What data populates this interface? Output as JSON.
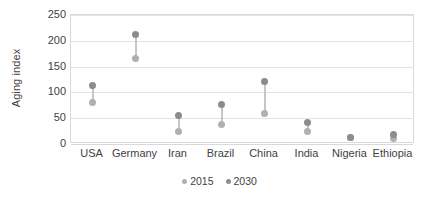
{
  "chart_data": {
    "type": "scatter",
    "title": "",
    "subtitle": "",
    "xlabel": "",
    "ylabel": "Aging index",
    "categories": [
      "USA",
      "Germany",
      "Iran",
      "Brazil",
      "China",
      "India",
      "Nigeria",
      "Ethiopia"
    ],
    "series": [
      {
        "name": "2015",
        "color": "#b0b0b0",
        "values": [
          80,
          165,
          24,
          37,
          60,
          25,
          12,
          10
        ]
      },
      {
        "name": "2030",
        "color": "#8c8c8c",
        "values": [
          114,
          213,
          56,
          77,
          121,
          42,
          12,
          18
        ]
      }
    ],
    "ylim": [
      0,
      250
    ],
    "yticks": [
      0,
      50,
      100,
      150,
      200,
      250
    ],
    "ytick_labels": [
      "0",
      "50",
      "100",
      "150",
      "200",
      "250"
    ],
    "grid": "horizontal",
    "legend_position": "bottom",
    "marker": "circle",
    "connector": true,
    "plot_border_color": "#d9d9d9",
    "gridline_color": "#e3e3e3",
    "background_color": "#ffffff",
    "text_color": "#3f3f3f"
  }
}
